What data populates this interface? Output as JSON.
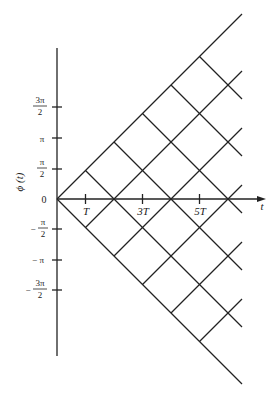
{
  "diagram": {
    "y_axis_label": "ϕ (t)",
    "x_axis_label": "t",
    "y_ticks": [
      {
        "num": "3π",
        "den": "2",
        "sign": "",
        "y": 107
      },
      {
        "text": "π",
        "sign": "",
        "y": 138
      },
      {
        "num": "π",
        "den": "2",
        "sign": "",
        "y": 169
      },
      {
        "text": "0",
        "y": 199
      },
      {
        "num": "π",
        "den": "2",
        "sign": "−",
        "y": 229
      },
      {
        "text": "π",
        "sign": "−",
        "y": 260
      },
      {
        "num": "3π",
        "den": "2",
        "sign": "−",
        "y": 290
      }
    ],
    "x_ticks": [
      "T",
      "3T",
      "5T"
    ],
    "labels": {
      "zero": "0",
      "pi": "π",
      "neg_pi": "− π",
      "three_pi": "3π",
      "two": "2",
      "minus": "−",
      "T": "T",
      "3T": "3T",
      "5T": "5T",
      "t": "t",
      "phi": "ϕ (t)"
    },
    "stroke_color": "#222222"
  }
}
